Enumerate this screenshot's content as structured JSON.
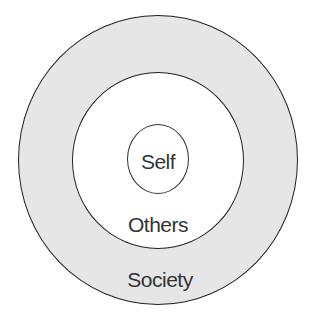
{
  "diagram": {
    "type": "concentric-circles",
    "rings": [
      {
        "id": "outer",
        "label": "Society",
        "fill": "#e6e6e6",
        "stroke": "#222222"
      },
      {
        "id": "middle",
        "label": "Others",
        "fill": "#ffffff",
        "stroke": "#222222"
      },
      {
        "id": "inner",
        "label": "Self",
        "fill": "#ffffff",
        "stroke": "#333333"
      }
    ],
    "labels": {
      "self": "Self",
      "others": "Others",
      "society": "Society"
    },
    "colors": {
      "outer_fill": "#e6e6e6",
      "text": "#333333",
      "stroke": "#222222",
      "background": "#ffffff"
    }
  }
}
